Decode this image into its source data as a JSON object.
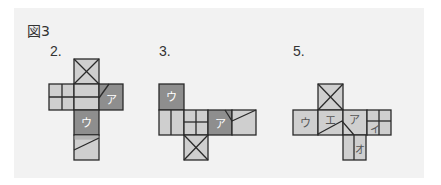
{
  "figure": {
    "title": "図3",
    "nets": [
      {
        "label": "2.",
        "faces": [
          "ア",
          "ウ"
        ]
      },
      {
        "label": "3.",
        "faces": [
          "ウ",
          "ア"
        ]
      },
      {
        "label": "5.",
        "faces": [
          "ウ",
          "エ",
          "ア",
          "イ",
          "オ"
        ]
      }
    ]
  },
  "colors": {
    "panel": "#f2f2f2",
    "light_face": "#cfcfcf",
    "dark_face": "#8e8e8e",
    "line": "#2a2a2a"
  }
}
